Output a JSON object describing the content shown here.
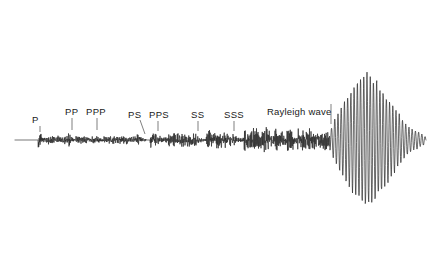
{
  "figure": {
    "type": "seismogram",
    "background_color": "#ffffff",
    "trace_color": "#2a2a2a",
    "label_color": "#1a1a1a",
    "width": 439,
    "height": 280,
    "baseline_y": 140
  },
  "labels": [
    {
      "id": "p",
      "text": "P",
      "x": 32,
      "y": 115,
      "tick_x": 40,
      "tick_y1": 126,
      "tick_y2": 132,
      "leader": "vertical"
    },
    {
      "id": "pp",
      "text": "PP",
      "x": 65,
      "y": 107,
      "tick_x": 72,
      "tick_y1": 118,
      "tick_y2": 130,
      "leader": "vertical"
    },
    {
      "id": "ppp",
      "text": "PPP",
      "x": 86,
      "y": 107,
      "tick_x": 97,
      "tick_y1": 118,
      "tick_y2": 130,
      "leader": "vertical"
    },
    {
      "id": "ps",
      "text": "PS",
      "x": 128,
      "y": 110,
      "tick_x": 140,
      "tick_y1": 120,
      "tick_y2": 134,
      "leader": "slant"
    },
    {
      "id": "pps",
      "text": "PPS",
      "x": 149,
      "y": 110,
      "tick_x": 158,
      "tick_y1": 121,
      "tick_y2": 131,
      "leader": "vertical"
    },
    {
      "id": "ss",
      "text": "SS",
      "x": 191,
      "y": 110,
      "tick_x": 198,
      "tick_y1": 121,
      "tick_y2": 131,
      "leader": "vertical"
    },
    {
      "id": "sss",
      "text": "SSS",
      "x": 224,
      "y": 110,
      "tick_x": 234,
      "tick_y1": 121,
      "tick_y2": 131,
      "leader": "vertical"
    },
    {
      "id": "rayleigh",
      "text": "Rayleigh wave",
      "x": 267,
      "y": 107,
      "tick_x": 331,
      "tick_y1": 104,
      "tick_y2": 124,
      "leader": "vertical"
    }
  ],
  "chart_data": {
    "type": "line",
    "title": "",
    "xlabel": "",
    "ylabel": "",
    "grid": false,
    "legend": "none",
    "baseline_y": 140,
    "x_range": [
      0,
      439
    ],
    "y_range": [
      0,
      280
    ],
    "trace_start_x": 15,
    "trace_end_x": 426,
    "segments": [
      {
        "name": "pre-event flat line",
        "x_start": 15,
        "x_end": 38,
        "amplitude": 0,
        "frequency": 0,
        "character": "flat"
      },
      {
        "name": "P arrival",
        "x_start": 38,
        "x_end": 46,
        "amplitude": 11,
        "frequency": 1.6,
        "character": "impulsive-spike"
      },
      {
        "name": "P coda",
        "x_start": 46,
        "x_end": 68,
        "amplitude": 3,
        "frequency": 1.1,
        "character": "low-amplitude"
      },
      {
        "name": "PP arrival",
        "x_start": 68,
        "x_end": 76,
        "amplitude": 7,
        "frequency": 1.5,
        "character": "burst"
      },
      {
        "name": "PP coda",
        "x_start": 76,
        "x_end": 94,
        "amplitude": 3,
        "frequency": 1.1,
        "character": "low-amplitude"
      },
      {
        "name": "PPP arrival",
        "x_start": 94,
        "x_end": 104,
        "amplitude": 7,
        "frequency": 1.5,
        "character": "burst"
      },
      {
        "name": "PPP coda",
        "x_start": 104,
        "x_end": 136,
        "amplitude": 3,
        "frequency": 1.1,
        "character": "low-amplitude"
      },
      {
        "name": "PS arrival",
        "x_start": 136,
        "x_end": 146,
        "amplitude": 8,
        "frequency": 1.4,
        "character": "burst"
      },
      {
        "name": "PPS arrival",
        "x_start": 150,
        "x_end": 168,
        "amplitude": 12,
        "frequency": 1.5,
        "character": "strong-burst"
      },
      {
        "name": "PPS coda",
        "x_start": 168,
        "x_end": 192,
        "amplitude": 5,
        "frequency": 1.2,
        "character": "moderate"
      },
      {
        "name": "SS arrival",
        "x_start": 192,
        "x_end": 206,
        "amplitude": 9,
        "frequency": 1.4,
        "character": "burst"
      },
      {
        "name": "S coda",
        "x_start": 206,
        "x_end": 230,
        "amplitude": 7,
        "frequency": 1.3,
        "character": "moderate"
      },
      {
        "name": "SSS arrival",
        "x_start": 230,
        "x_end": 244,
        "amplitude": 9,
        "frequency": 1.4,
        "character": "burst"
      },
      {
        "name": "surface-wave onset",
        "x_start": 244,
        "x_end": 330,
        "amplitude": 8,
        "frequency": 1.25,
        "character": "moderate-irregular"
      },
      {
        "name": "Rayleigh wave packet",
        "x_start": 330,
        "x_end": 426,
        "amplitude": 130,
        "frequency": 0.62,
        "character": "large-spindle-envelope",
        "peak_x": 367,
        "peak_amplitude": 130
      }
    ],
    "envelope": {
      "description": "Rayleigh wave spindle envelope peaking near x=367",
      "points": [
        {
          "x": 330,
          "amp": 20
        },
        {
          "x": 336,
          "amp": 46
        },
        {
          "x": 342,
          "amp": 68
        },
        {
          "x": 348,
          "amp": 88
        },
        {
          "x": 354,
          "amp": 104
        },
        {
          "x": 360,
          "amp": 120
        },
        {
          "x": 367,
          "amp": 130
        },
        {
          "x": 374,
          "amp": 120
        },
        {
          "x": 380,
          "amp": 105
        },
        {
          "x": 386,
          "amp": 88
        },
        {
          "x": 392,
          "amp": 70
        },
        {
          "x": 398,
          "amp": 52
        },
        {
          "x": 404,
          "amp": 36
        },
        {
          "x": 410,
          "amp": 24
        },
        {
          "x": 416,
          "amp": 18
        },
        {
          "x": 422,
          "amp": 12
        },
        {
          "x": 426,
          "amp": 6
        }
      ]
    }
  }
}
